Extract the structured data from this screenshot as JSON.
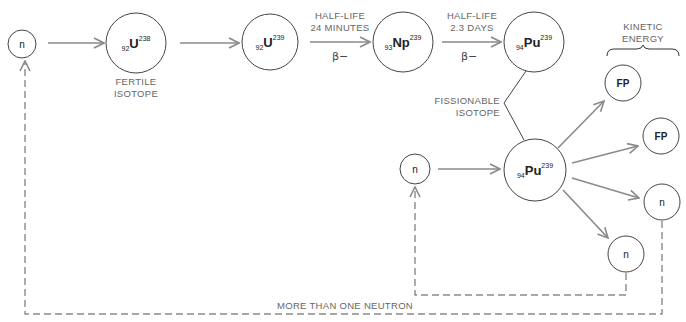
{
  "diagram": {
    "colors": {
      "circle_stroke": "#444444",
      "arrow": "#8a8a8a",
      "text": "#666666"
    },
    "nodes": {
      "neutron_start": {
        "label": "n"
      },
      "u238": {
        "sub": "92",
        "symbol": "U",
        "sup": "238",
        "caption_line1": "FERTILE",
        "caption_line2": "ISOTOPE"
      },
      "u239": {
        "sub": "92",
        "symbol": "U",
        "sup": "239"
      },
      "np239": {
        "sub": "93",
        "symbol": "Np",
        "sup": "239"
      },
      "pu239_top": {
        "sub": "94",
        "symbol": "Pu",
        "sup": "239"
      },
      "neutron_mid": {
        "label": "n"
      },
      "pu239_bottom": {
        "sub": "94",
        "symbol": "Pu",
        "sup": "239"
      },
      "fp1": {
        "label": "FP"
      },
      "fp2": {
        "label": "FP"
      },
      "neutron_out1": {
        "label": "n"
      },
      "neutron_out2": {
        "label": "n"
      }
    },
    "transitions": {
      "u239_to_np": {
        "line1": "HALF-LIFE",
        "line2": "24 MINUTES",
        "decay": "β−"
      },
      "np_to_pu": {
        "line1": "HALF-LIFE",
        "line2": "2.3 DAYS",
        "decay": "β−"
      }
    },
    "fissionable_label": {
      "line1": "FISSIONABLE",
      "line2": "ISOTOPE"
    },
    "kinetic_energy_label": {
      "line1": "KINETIC",
      "line2": "ENERGY"
    },
    "feedback_label": "MORE THAN ONE NEUTRON"
  }
}
